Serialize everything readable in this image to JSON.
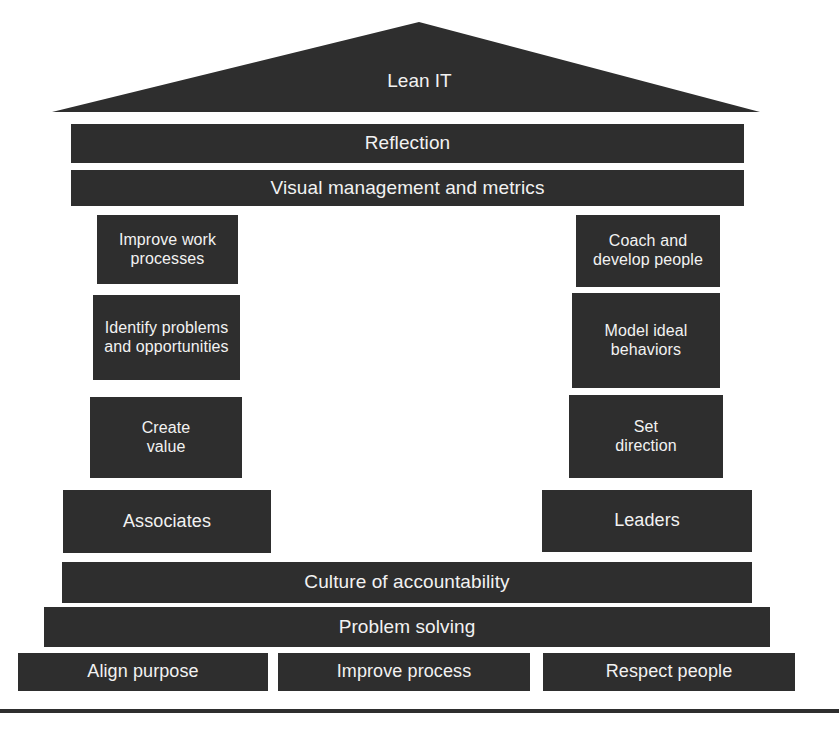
{
  "diagram": {
    "title": "Lean IT",
    "type": "lean-house",
    "accent_color": "#2e2e2e",
    "text_color": "#f2f2f2",
    "background_color": "#ffffff",
    "roof": {
      "label": "Lean IT"
    },
    "top_bars": [
      {
        "label": "Reflection"
      },
      {
        "label": "Visual management and metrics"
      }
    ],
    "left_pillar": {
      "boxes": [
        {
          "label": "Improve work\nprocesses",
          "line1": "Improve work",
          "line2": "processes"
        },
        {
          "label": "Identify problems\nand opportunities",
          "line1": "Identify problems",
          "line2": "and opportunities"
        },
        {
          "label": "Create\nvalue",
          "line1": "Create",
          "line2": "value"
        }
      ],
      "footer": {
        "label": "Associates"
      }
    },
    "right_pillar": {
      "boxes": [
        {
          "label": "Coach and\ndevelop people",
          "line1": "Coach and",
          "line2": "develop people"
        },
        {
          "label": "Model ideal\nbehaviors",
          "line1": "Model ideal",
          "line2": "behaviors"
        },
        {
          "label": "Set\ndirection",
          "line1": "Set",
          "line2": "direction"
        }
      ],
      "footer": {
        "label": "Leaders"
      }
    },
    "foundation_bars": [
      {
        "label": "Culture of accountability"
      },
      {
        "label": "Problem solving"
      }
    ],
    "base_bars": [
      {
        "label": "Align purpose"
      },
      {
        "label": "Improve process"
      },
      {
        "label": "Respect people"
      }
    ]
  }
}
